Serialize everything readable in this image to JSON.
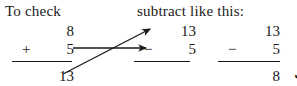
{
  "figure": {
    "background_color": "#ffffff",
    "ink_color": "#1a1a1a"
  },
  "headers": {
    "left": "To check",
    "right": "subtract like this:"
  },
  "columns": [
    {
      "id": "check",
      "role": "addition-check",
      "rows": [
        {
          "operator": "",
          "number": "8"
        },
        {
          "operator": "+",
          "number": "5"
        }
      ],
      "has_rule": true,
      "result": "13",
      "result_marked_correct": false,
      "check_symbol": ""
    },
    {
      "id": "subtract",
      "role": "subtraction-problem",
      "rows": [
        {
          "operator": "",
          "number": "13"
        },
        {
          "operator": "−",
          "number": "5"
        }
      ],
      "has_rule": true,
      "result": "",
      "result_marked_correct": false,
      "check_symbol": ""
    },
    {
      "id": "answer",
      "role": "subtraction-solved",
      "rows": [
        {
          "operator": "",
          "number": "13"
        },
        {
          "operator": "−",
          "number": "5"
        }
      ],
      "has_rule": true,
      "result": "8",
      "result_marked_correct": true,
      "check_symbol": "✓"
    }
  ],
  "arrows": [
    {
      "id": "minuend-arrow",
      "description": "diagonal arrow from the sum 13 up to the minuend 13",
      "from": {
        "x": 63,
        "y": 74
      },
      "to": {
        "x": 150,
        "y": 29
      },
      "color": "#1a1a1a"
    },
    {
      "id": "subtrahend-arrow",
      "description": "horizontal arrow from the addend 5 to the subtrahend 5",
      "from": {
        "x": 73,
        "y": 48
      },
      "to": {
        "x": 146,
        "y": 48
      },
      "color": "#1a1a1a"
    }
  ]
}
